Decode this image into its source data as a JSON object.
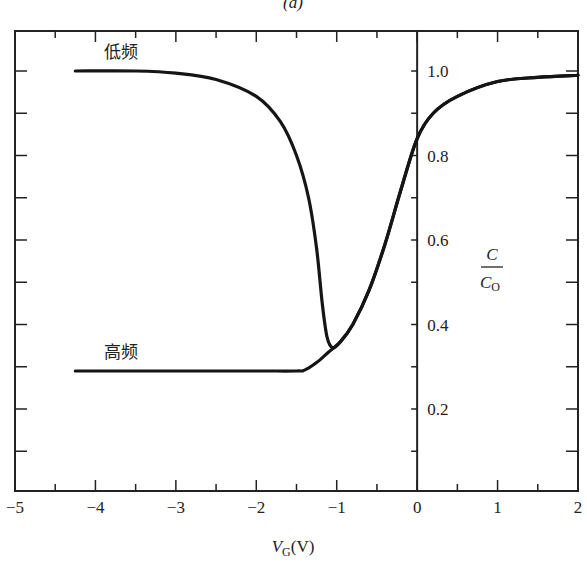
{
  "figure": {
    "caption": "(a)"
  },
  "chart_data": {
    "type": "line",
    "title": "",
    "xlabel": "V_G (V)",
    "xlabel_main": "V",
    "xlabel_sub": "G",
    "xlabel_unit": "(V)",
    "ylabel": "C / C_O",
    "ylabel_num": "C",
    "ylabel_den_main": "C",
    "ylabel_den_sub": "O",
    "xlim": [
      -5,
      2
    ],
    "ylim": [
      0,
      1.1
    ],
    "x_ticks": [
      "-5",
      "-4",
      "-3",
      "-2",
      "-1",
      "0",
      "1",
      "2"
    ],
    "y_ticks": [
      "0.2",
      "0.4",
      "0.6",
      "0.8",
      "1.0"
    ],
    "grid": false,
    "y_axis_position": "x=0",
    "series": [
      {
        "name": "低频",
        "label": "low frequency",
        "x": [
          -4.25,
          -3.5,
          -3.0,
          -2.5,
          -2.0,
          -1.7,
          -1.5,
          -1.35,
          -1.25,
          -1.18,
          -1.12,
          -1.05,
          -0.95,
          -0.8,
          -0.6,
          -0.4,
          -0.2,
          0.0,
          0.2,
          0.5,
          1.0,
          1.5,
          2.0
        ],
        "y": [
          1.0,
          1.0,
          0.995,
          0.98,
          0.94,
          0.88,
          0.8,
          0.7,
          0.58,
          0.45,
          0.37,
          0.345,
          0.36,
          0.4,
          0.48,
          0.59,
          0.72,
          0.84,
          0.9,
          0.94,
          0.975,
          0.985,
          0.99
        ]
      },
      {
        "name": "高频",
        "label": "high frequency",
        "x": [
          -4.25,
          -3.0,
          -2.0,
          -1.5,
          -1.4,
          -1.25,
          -1.1,
          -0.95,
          -0.8,
          -0.6,
          -0.4,
          -0.2,
          0.0,
          0.2,
          0.5,
          1.0,
          1.5,
          2.0
        ],
        "y": [
          0.29,
          0.29,
          0.29,
          0.29,
          0.292,
          0.31,
          0.335,
          0.36,
          0.4,
          0.48,
          0.59,
          0.72,
          0.84,
          0.9,
          0.94,
          0.975,
          0.985,
          0.99
        ]
      }
    ],
    "annotations": [
      {
        "text": "低频",
        "x": -3.5,
        "y": 1.03
      },
      {
        "text": "高频",
        "x": -3.5,
        "y": 0.32
      }
    ]
  }
}
